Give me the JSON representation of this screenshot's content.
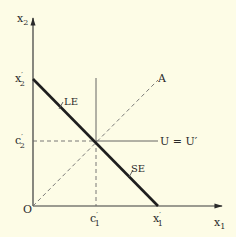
{
  "figure": {
    "type": "economics-budget-diagram",
    "background": "#fdfce6",
    "axes": {
      "x_label": {
        "main": "x",
        "sub": "1"
      },
      "y_label": {
        "main": "x",
        "sub": "2"
      },
      "origin_label": "O"
    },
    "ticks": {
      "x2_prime": {
        "main": "x",
        "prime": "′",
        "sub": "2"
      },
      "c2_prime": {
        "main": "c",
        "prime": "′",
        "sub": "2"
      },
      "c1_prime": {
        "main": "c",
        "prime": "′",
        "sub": "1"
      },
      "x1_prime": {
        "main": "x",
        "prime": "′",
        "sub": "1"
      }
    },
    "lines": {
      "budget_line": "thick line from x2' on vertical axis to x1' on horizontal axis",
      "ray_A": "dashed 45-degree ray from origin O to point A",
      "vertical_c1": "solid vertical line at c1'",
      "horizontal_c2": "dashed from axis to intersection, solid beyond, labelled U = U'"
    },
    "labels": {
      "ray_end": "A",
      "horizontal_line": "U = U′",
      "upper_marker": "LE",
      "lower_marker": "SE"
    }
  }
}
